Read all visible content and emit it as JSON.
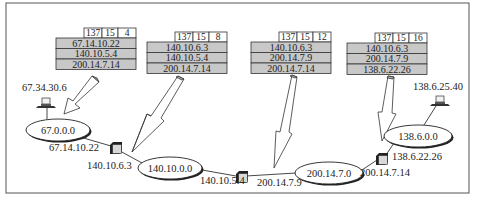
{
  "diagram": {
    "frame": {
      "x": 6,
      "y": 3,
      "w": 463,
      "h": 190,
      "stroke": "#555555"
    },
    "colors": {
      "table_header_bg": "#ffffff",
      "table_row_bg": "#c8c8c8",
      "ellipse_fill": "#ffffff",
      "router_fill": "#d8d8d8",
      "arrow_fill": "#ffffff",
      "arrow_shade": "#b0b0b0",
      "line": "#333333"
    },
    "packets": [
      {
        "id": "p1",
        "x": 56,
        "y": 28,
        "header": [
          "137",
          "15",
          "4"
        ],
        "rows": [
          "67.14.10.22",
          "140.10.5.4",
          "200.14.7.14"
        ]
      },
      {
        "id": "p2",
        "x": 147,
        "y": 32,
        "header": [
          "137",
          "15",
          "8"
        ],
        "rows": [
          "140.10.6.3",
          "140.10.5.4",
          "200.14.7.14"
        ]
      },
      {
        "id": "p3",
        "x": 251,
        "y": 32,
        "header": [
          "137",
          "15",
          "12"
        ],
        "rows": [
          "140.10.6.3",
          "200.14.7.9",
          "200.14.7.14"
        ]
      },
      {
        "id": "p4",
        "x": 347,
        "y": 33,
        "header": [
          "137",
          "15",
          "16"
        ],
        "rows": [
          "140.10.6.3",
          "200.14.7.9",
          "138.6.22.26"
        ]
      }
    ],
    "networks": [
      {
        "id": "n1",
        "label": "67.0.0.0",
        "cx": 58,
        "cy": 130,
        "rx": 32,
        "ry": 11
      },
      {
        "id": "n2",
        "label": "140.10.0.0",
        "cx": 170,
        "cy": 168,
        "rx": 32,
        "ry": 11
      },
      {
        "id": "n3",
        "label": "200.14.7.0",
        "cx": 329,
        "cy": 173,
        "rx": 34,
        "ry": 11
      },
      {
        "id": "n4",
        "label": "138.6.0.0",
        "cx": 418,
        "cy": 136,
        "rx": 34,
        "ry": 11
      }
    ],
    "hosts": [
      {
        "id": "h1",
        "label": "67.34.30.6",
        "x": 46,
        "y": 100,
        "label_x": 22,
        "label_y": 91
      },
      {
        "id": "h2",
        "label": "138.6.25.40",
        "x": 440,
        "y": 98,
        "label_x": 413,
        "label_y": 90
      }
    ],
    "routers": [
      {
        "id": "r1",
        "x": 110,
        "y": 142
      },
      {
        "id": "r2",
        "x": 236,
        "y": 171
      },
      {
        "id": "r3",
        "x": 376,
        "y": 153
      }
    ],
    "address_labels": [
      {
        "text": "67.14.10.22",
        "x": 49,
        "y": 151
      },
      {
        "text": "140.10.6.3",
        "x": 87,
        "y": 169
      },
      {
        "text": "140.10.5.4",
        "x": 200,
        "y": 184
      },
      {
        "text": "200.14.7.9",
        "x": 257,
        "y": 186
      },
      {
        "text": "200.14.7.14",
        "x": 360,
        "y": 176
      },
      {
        "text": "138.6.22.26",
        "x": 392,
        "y": 160
      }
    ]
  }
}
